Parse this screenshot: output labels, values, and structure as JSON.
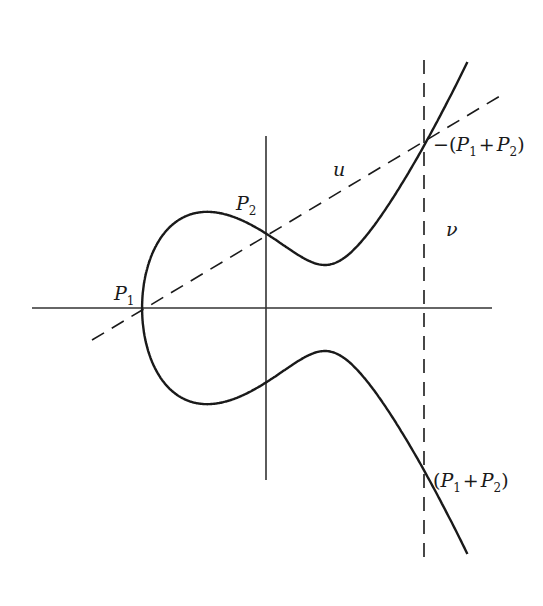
{
  "figure": {
    "curve_equation_shape": "y^2 = x^3 + a x + b (two components: oval and unbounded branch)",
    "axes": {
      "x_axis": true,
      "y_axis": true
    },
    "lines": [
      {
        "id": "u",
        "label": "u",
        "style": "dashed",
        "through": [
          "P1",
          "P2",
          "-(P1+P2)"
        ]
      },
      {
        "id": "v",
        "label": "v",
        "style": "dashed",
        "orientation": "vertical",
        "through": [
          "-(P1+P2)",
          "(P1+P2)"
        ]
      }
    ],
    "points": [
      {
        "id": "P1",
        "base": "P",
        "sub": "1"
      },
      {
        "id": "P2",
        "base": "P",
        "sub": "2"
      },
      {
        "id": "neg_sum",
        "prefix": "−(",
        "a_base": "P",
        "a_sub": "1",
        "op": "+",
        "b_base": "P",
        "b_sub": "2",
        "suffix": ")"
      },
      {
        "id": "sum",
        "prefix": "(",
        "a_base": "P",
        "a_sub": "1",
        "op": "+",
        "b_base": "P",
        "b_sub": "2",
        "suffix": ")"
      }
    ],
    "labels": {
      "u": "u",
      "v": "ν"
    }
  },
  "colors": {
    "stroke": "#1a1a1a",
    "axis": "#333333",
    "background": "#ffffff"
  }
}
